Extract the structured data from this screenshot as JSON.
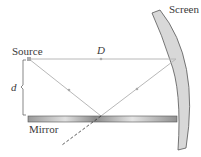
{
  "diagram": {
    "labels": {
      "screen": "Screen",
      "source": "Source",
      "distance": "D",
      "height": "d",
      "mirror": "Mirror"
    },
    "colors": {
      "ray": "#b8b8b8",
      "screen_fill": "#d8d8d8",
      "screen_stroke": "#555555",
      "mirror_dark": "#8a8a8a",
      "mirror_light": "#e6e6e6",
      "text": "#3a3a3a"
    }
  }
}
